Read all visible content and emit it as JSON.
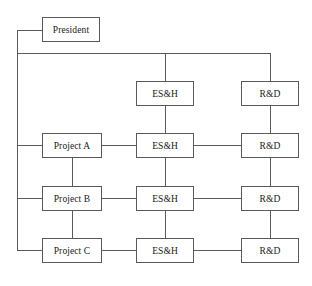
{
  "diagram": {
    "type": "org-chart",
    "line_color": "#5a5a5a",
    "background_color": "#ffffff",
    "nodes": [
      {
        "id": "president",
        "label": "President",
        "x": 42,
        "y": 17,
        "w": 58,
        "h": 25
      },
      {
        "id": "esh-corp",
        "label": "ES&H",
        "x": 136,
        "y": 81,
        "w": 58,
        "h": 25
      },
      {
        "id": "rd-corp",
        "label": "R&D",
        "x": 241,
        "y": 81,
        "w": 58,
        "h": 25
      },
      {
        "id": "project-a",
        "label": "Project A",
        "x": 42,
        "y": 133,
        "w": 60,
        "h": 25
      },
      {
        "id": "esh-a",
        "label": "ES&H",
        "x": 136,
        "y": 133,
        "w": 58,
        "h": 25
      },
      {
        "id": "rd-a",
        "label": "R&D",
        "x": 241,
        "y": 133,
        "w": 58,
        "h": 25
      },
      {
        "id": "project-b",
        "label": "Project B",
        "x": 42,
        "y": 186,
        "w": 60,
        "h": 25
      },
      {
        "id": "esh-b",
        "label": "ES&H",
        "x": 136,
        "y": 186,
        "w": 58,
        "h": 25
      },
      {
        "id": "rd-b",
        "label": "R&D",
        "x": 241,
        "y": 186,
        "w": 58,
        "h": 25
      },
      {
        "id": "project-c",
        "label": "Project C",
        "x": 42,
        "y": 238,
        "w": 60,
        "h": 25
      },
      {
        "id": "esh-c",
        "label": "ES&H",
        "x": 136,
        "y": 238,
        "w": 58,
        "h": 25
      },
      {
        "id": "rd-c",
        "label": "R&D",
        "x": 241,
        "y": 238,
        "w": 58,
        "h": 25
      }
    ],
    "edges": [
      {
        "id": "president-to-spine",
        "orient": "h",
        "x": 17,
        "y": 30,
        "len": 25
      },
      {
        "id": "left-spine",
        "orient": "v",
        "x": 17,
        "y": 30,
        "len": 221
      },
      {
        "id": "top-bus",
        "orient": "h",
        "x": 17,
        "y": 53,
        "len": 254
      },
      {
        "id": "bus-drop-esh",
        "orient": "v",
        "x": 165,
        "y": 53,
        "len": 28
      },
      {
        "id": "bus-drop-rd",
        "orient": "v",
        "x": 270,
        "y": 53,
        "len": 28
      },
      {
        "id": "spine-to-project-a",
        "orient": "h",
        "x": 17,
        "y": 145,
        "len": 25
      },
      {
        "id": "spine-to-project-b",
        "orient": "h",
        "x": 17,
        "y": 198,
        "len": 25
      },
      {
        "id": "spine-to-project-c",
        "orient": "h",
        "x": 17,
        "y": 250,
        "len": 25
      },
      {
        "id": "project-a-to-esh-a",
        "orient": "h",
        "x": 102,
        "y": 145,
        "len": 34
      },
      {
        "id": "esh-a-to-rd-a",
        "orient": "h",
        "x": 194,
        "y": 145,
        "len": 47
      },
      {
        "id": "project-b-to-esh-b",
        "orient": "h",
        "x": 102,
        "y": 198,
        "len": 34
      },
      {
        "id": "esh-b-to-rd-b",
        "orient": "h",
        "x": 194,
        "y": 198,
        "len": 47
      },
      {
        "id": "project-c-to-esh-c",
        "orient": "h",
        "x": 102,
        "y": 250,
        "len": 34
      },
      {
        "id": "esh-c-to-rd-c",
        "orient": "h",
        "x": 194,
        "y": 250,
        "len": 47
      },
      {
        "id": "esh-corp-to-esh-a",
        "orient": "v",
        "x": 165,
        "y": 106,
        "len": 27
      },
      {
        "id": "esh-a-to-esh-b",
        "orient": "v",
        "x": 165,
        "y": 158,
        "len": 28
      },
      {
        "id": "esh-b-to-esh-c",
        "orient": "v",
        "x": 165,
        "y": 211,
        "len": 27
      },
      {
        "id": "rd-corp-to-rd-a",
        "orient": "v",
        "x": 270,
        "y": 106,
        "len": 27
      },
      {
        "id": "rd-a-to-rd-b",
        "orient": "v",
        "x": 270,
        "y": 158,
        "len": 28
      },
      {
        "id": "rd-b-to-rd-c",
        "orient": "v",
        "x": 270,
        "y": 211,
        "len": 27
      },
      {
        "id": "project-a-to-project-b",
        "orient": "v",
        "x": 72,
        "y": 158,
        "len": 28
      },
      {
        "id": "project-b-to-project-c",
        "orient": "v",
        "x": 72,
        "y": 211,
        "len": 27
      }
    ]
  }
}
